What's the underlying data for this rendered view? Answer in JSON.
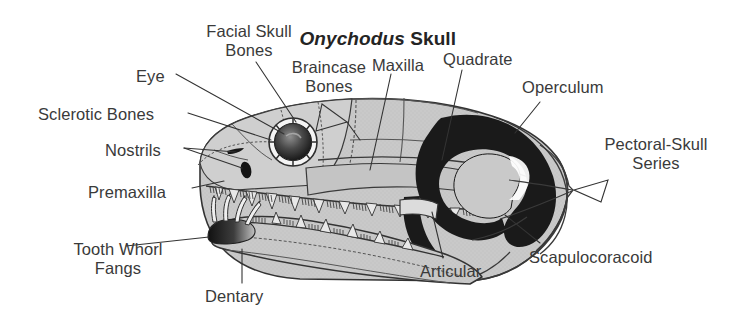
{
  "figure": {
    "title_genus": "Onychodus",
    "title_rest": " Skull",
    "title_full": "Onychodus Skull",
    "background_color": "#ffffff",
    "text_color": "#3a3a3a",
    "title_color": "#242424",
    "bone_fill_color": "#c9c9c9",
    "bone_fill_light": "#d8d8d8",
    "dark_element_color": "#1a1a1a",
    "outline_color": "#333333"
  },
  "labels": [
    {
      "id": "facial-skull-bones",
      "text": "Facial Skull\nBones",
      "x": 189,
      "y": 22,
      "align": "center",
      "width": 120
    },
    {
      "id": "braincase-bones",
      "text": "Braincase\nBones",
      "x": 276,
      "y": 58,
      "align": "center",
      "width": 106
    },
    {
      "id": "maxilla",
      "text": "Maxilla",
      "x": 372,
      "y": 56,
      "align": "left",
      "width": 70
    },
    {
      "id": "quadrate",
      "text": "Quadrate",
      "x": 443,
      "y": 50,
      "align": "left",
      "width": 84
    },
    {
      "id": "operculum",
      "text": "Operculum",
      "x": 522,
      "y": 78,
      "align": "left",
      "width": 98
    },
    {
      "id": "pectoral-skull-series",
      "text": "Pectoral-Skull\nSeries",
      "x": 588,
      "y": 135,
      "align": "center",
      "width": 130
    },
    {
      "id": "scapulocoracoid",
      "text": "Scapulocoracoid",
      "x": 529,
      "y": 248,
      "align": "left",
      "width": 150
    },
    {
      "id": "articular",
      "text": "Articular",
      "x": 420,
      "y": 262,
      "align": "left",
      "width": 82
    },
    {
      "id": "dentary",
      "text": "Dentary",
      "x": 205,
      "y": 287,
      "align": "left",
      "width": 76
    },
    {
      "id": "tooth-whorl-fangs",
      "text": "Tooth Whorl\nFangs",
      "x": 62,
      "y": 240,
      "align": "center",
      "width": 116
    },
    {
      "id": "premaxilla",
      "text": "Premaxilla",
      "x": 88,
      "y": 183,
      "align": "left",
      "width": 100
    },
    {
      "id": "nostrils",
      "text": "Nostrils",
      "x": 105,
      "y": 141,
      "align": "left",
      "width": 74
    },
    {
      "id": "sclerotic-bones",
      "text": "Sclerotic Bones",
      "x": 38,
      "y": 105,
      "align": "left",
      "width": 146
    },
    {
      "id": "eye",
      "text": "Eye",
      "x": 136,
      "y": 67,
      "align": "left",
      "width": 38
    }
  ],
  "anatomy_parts": [
    "Facial Skull Bones",
    "Braincase Bones",
    "Maxilla",
    "Quadrate",
    "Operculum",
    "Pectoral-Skull Series",
    "Scapulocoracoid",
    "Articular",
    "Dentary",
    "Tooth Whorl Fangs",
    "Premaxilla",
    "Nostrils",
    "Sclerotic Bones",
    "Eye"
  ]
}
